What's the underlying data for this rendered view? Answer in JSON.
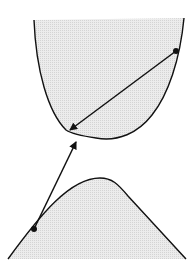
{
  "diagram": {
    "colors": {
      "stroke": "#111111",
      "fill": "#e6e6e6",
      "background": "#ffffff"
    },
    "regions": [
      {
        "name": "upper-region",
        "shape": "convex cup (opens upward)"
      },
      {
        "name": "lower-region",
        "shape": "concave hill (opens downward)"
      }
    ],
    "points": [
      {
        "name": "point-upper-right",
        "on": "upper-region boundary"
      },
      {
        "name": "point-lower-left",
        "on": "lower-region boundary"
      }
    ],
    "arrows": [
      {
        "name": "arrow-upper",
        "from": "point-upper-right",
        "to": "upper-region bottom-left boundary"
      },
      {
        "name": "arrow-lower",
        "from": "point-lower-left",
        "to": "upper-region bottom boundary"
      }
    ]
  }
}
